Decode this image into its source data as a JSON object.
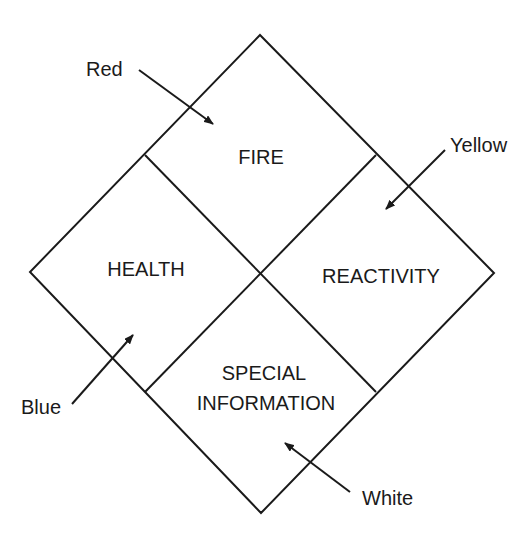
{
  "diagram": {
    "type": "nfpa-704-fire-diamond",
    "stroke_color": "#1a1a1a",
    "quadrants": {
      "top": {
        "label": "FIRE"
      },
      "left": {
        "label": "HEALTH"
      },
      "right": {
        "label": "REACTIVITY"
      },
      "bottom": {
        "label_line1": "SPECIAL",
        "label_line2": "INFORMATION"
      }
    },
    "callouts": {
      "red": {
        "label": "Red",
        "points_to": "FIRE"
      },
      "yellow": {
        "label": "Yellow",
        "points_to": "REACTIVITY"
      },
      "blue": {
        "label": "Blue",
        "points_to": "HEALTH"
      },
      "white": {
        "label": "White",
        "points_to": "SPECIAL INFORMATION"
      }
    }
  }
}
